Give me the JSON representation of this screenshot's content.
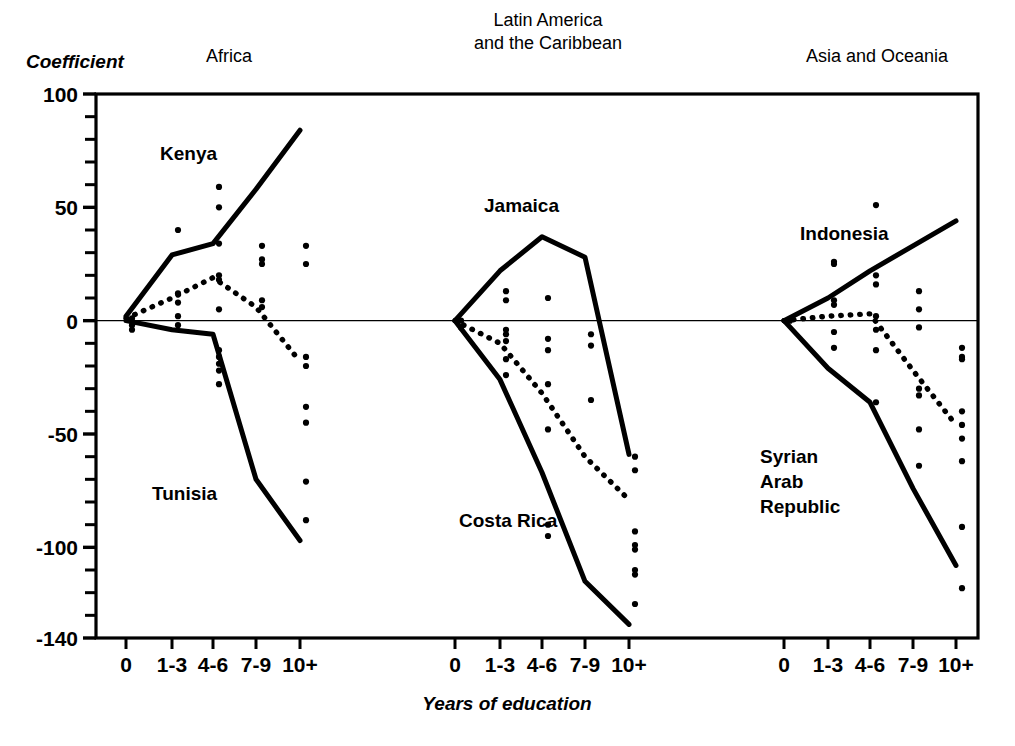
{
  "figure": {
    "y_axis_title": "Coefficient",
    "x_axis_title": "Years of education"
  },
  "chart_data": {
    "type": "scatter",
    "title": "",
    "subtitle": "",
    "xlabel": "Years of education",
    "ylabel": "Coefficient",
    "categories": [
      "0",
      "1-3",
      "4-6",
      "7-9",
      "10+"
    ],
    "ylim": [
      -140,
      100
    ],
    "yticks": [
      100,
      50,
      0,
      -50,
      -100,
      -140
    ],
    "ytick_labels": [
      "100",
      "50",
      "0",
      "-50",
      "-100",
      "-140"
    ],
    "minor_tick_step": 10,
    "grid": false,
    "legend_position": "none",
    "zero_reference_line": 0,
    "panels": [
      {
        "name": "africa",
        "title": "Africa",
        "title_lines": [
          "Africa"
        ],
        "series": [
          {
            "name": "Kenya",
            "role": "upper-envelope",
            "style": "solid",
            "label": "Kenya",
            "x": [
              "0",
              "1-3",
              "4-6",
              "7-9",
              "10+"
            ],
            "values": [
              2,
              29,
              34,
              58,
              84
            ]
          },
          {
            "name": "Tunisia",
            "role": "lower-envelope",
            "style": "solid",
            "label": "Tunisia",
            "x": [
              "0",
              "1-3",
              "4-6",
              "7-9",
              "10+"
            ],
            "values": [
              0,
              -4,
              -6,
              -70,
              -97
            ]
          },
          {
            "name": "median",
            "role": "median",
            "style": "dotted",
            "label": "",
            "x": [
              "0",
              "1-3",
              "4-6",
              "7-9",
              "10+"
            ],
            "values": [
              1,
              10,
              19,
              6,
              -18
            ]
          }
        ],
        "scatter": [
          {
            "x": "0",
            "y": 1
          },
          {
            "x": "0",
            "y": -2
          },
          {
            "x": "0",
            "y": -4
          },
          {
            "x": "1-3",
            "y": 40
          },
          {
            "x": "1-3",
            "y": 12
          },
          {
            "x": "1-3",
            "y": 8
          },
          {
            "x": "1-3",
            "y": 2
          },
          {
            "x": "1-3",
            "y": -2
          },
          {
            "x": "4-6",
            "y": 59
          },
          {
            "x": "4-6",
            "y": 50
          },
          {
            "x": "4-6",
            "y": 34
          },
          {
            "x": "4-6",
            "y": 20
          },
          {
            "x": "4-6",
            "y": 18
          },
          {
            "x": "4-6",
            "y": 5
          },
          {
            "x": "4-6",
            "y": -13
          },
          {
            "x": "4-6",
            "y": -16
          },
          {
            "x": "4-6",
            "y": -19
          },
          {
            "x": "4-6",
            "y": -22
          },
          {
            "x": "4-6",
            "y": -28
          },
          {
            "x": "7-9",
            "y": 33
          },
          {
            "x": "7-9",
            "y": 27
          },
          {
            "x": "7-9",
            "y": 25
          },
          {
            "x": "7-9",
            "y": 9
          },
          {
            "x": "7-9",
            "y": 6
          },
          {
            "x": "10+",
            "y": 33
          },
          {
            "x": "10+",
            "y": 25
          },
          {
            "x": "10+",
            "y": -16
          },
          {
            "x": "10+",
            "y": -20
          },
          {
            "x": "10+",
            "y": -38
          },
          {
            "x": "10+",
            "y": -45
          },
          {
            "x": "10+",
            "y": -71
          },
          {
            "x": "10+",
            "y": -88
          }
        ]
      },
      {
        "name": "latin-america",
        "title": "Latin America and the Caribbean",
        "title_lines": [
          "Latin America",
          "and the Caribbean"
        ],
        "series": [
          {
            "name": "Jamaica",
            "role": "upper-envelope",
            "style": "solid",
            "label": "Jamaica",
            "x": [
              "0",
              "1-3",
              "4-6",
              "7-9",
              "10+"
            ],
            "values": [
              0,
              22,
              37,
              28,
              -59
            ]
          },
          {
            "name": "Costa Rica",
            "role": "lower-envelope",
            "style": "solid",
            "label": "Costa Rica",
            "x": [
              "0",
              "1-3",
              "4-6",
              "7-9",
              "10+"
            ],
            "values": [
              0,
              -26,
              -67,
              -115,
              -134
            ]
          },
          {
            "name": "median",
            "role": "median",
            "style": "dotted",
            "label": "",
            "x": [
              "0",
              "1-3",
              "4-6",
              "7-9",
              "10+"
            ],
            "values": [
              0,
              -10,
              -32,
              -60,
              -79
            ]
          }
        ],
        "scatter": [
          {
            "x": "0",
            "y": 0
          },
          {
            "x": "0",
            "y": -3
          },
          {
            "x": "1-3",
            "y": 13
          },
          {
            "x": "1-3",
            "y": 9
          },
          {
            "x": "1-3",
            "y": -4
          },
          {
            "x": "1-3",
            "y": -6
          },
          {
            "x": "1-3",
            "y": -9
          },
          {
            "x": "1-3",
            "y": -17
          },
          {
            "x": "1-3",
            "y": -24
          },
          {
            "x": "4-6",
            "y": 10
          },
          {
            "x": "4-6",
            "y": -8
          },
          {
            "x": "4-6",
            "y": -13
          },
          {
            "x": "4-6",
            "y": -28
          },
          {
            "x": "4-6",
            "y": -48
          },
          {
            "x": "4-6",
            "y": -90
          },
          {
            "x": "4-6",
            "y": -95
          },
          {
            "x": "7-9",
            "y": -6
          },
          {
            "x": "7-9",
            "y": -11
          },
          {
            "x": "7-9",
            "y": -35
          },
          {
            "x": "10+",
            "y": -60
          },
          {
            "x": "10+",
            "y": -66
          },
          {
            "x": "10+",
            "y": -93
          },
          {
            "x": "10+",
            "y": -99
          },
          {
            "x": "10+",
            "y": -101
          },
          {
            "x": "10+",
            "y": -110
          },
          {
            "x": "10+",
            "y": -112
          },
          {
            "x": "10+",
            "y": -125
          }
        ]
      },
      {
        "name": "asia-oceania",
        "title": "Asia and Oceania",
        "title_lines": [
          "Asia and Oceania"
        ],
        "series": [
          {
            "name": "Indonesia",
            "role": "upper-envelope",
            "style": "solid",
            "label": "Indonesia",
            "x": [
              "0",
              "1-3",
              "4-6",
              "7-9",
              "10+"
            ],
            "values": [
              0,
              10,
              22,
              33,
              44
            ]
          },
          {
            "name": "Syrian Arab Republic",
            "role": "lower-envelope",
            "style": "solid",
            "label": "Syrian Arab Republic",
            "label_lines": [
              "Syrian",
              "Arab",
              "Republic"
            ],
            "x": [
              "0",
              "1-3",
              "4-6",
              "7-9",
              "10+"
            ],
            "values": [
              0,
              -21,
              -36,
              -74,
              -108
            ]
          },
          {
            "name": "median",
            "role": "median",
            "style": "dotted",
            "label": "",
            "x": [
              "0",
              "1-3",
              "4-6",
              "7-9",
              "10+"
            ],
            "values": [
              0,
              2,
              3,
              -22,
              -46
            ]
          }
        ],
        "scatter": [
          {
            "x": "0",
            "y": 0
          },
          {
            "x": "1-3",
            "y": 26
          },
          {
            "x": "1-3",
            "y": 25
          },
          {
            "x": "1-3",
            "y": 9
          },
          {
            "x": "1-3",
            "y": 7
          },
          {
            "x": "1-3",
            "y": -5
          },
          {
            "x": "1-3",
            "y": -12
          },
          {
            "x": "4-6",
            "y": 51
          },
          {
            "x": "4-6",
            "y": 20
          },
          {
            "x": "4-6",
            "y": 16
          },
          {
            "x": "4-6",
            "y": 2
          },
          {
            "x": "4-6",
            "y": -4
          },
          {
            "x": "4-6",
            "y": -13
          },
          {
            "x": "4-6",
            "y": -36
          },
          {
            "x": "7-9",
            "y": 13
          },
          {
            "x": "7-9",
            "y": 5
          },
          {
            "x": "7-9",
            "y": -3
          },
          {
            "x": "7-9",
            "y": -30
          },
          {
            "x": "7-9",
            "y": -33
          },
          {
            "x": "7-9",
            "y": -48
          },
          {
            "x": "7-9",
            "y": -64
          },
          {
            "x": "10+",
            "y": -12
          },
          {
            "x": "10+",
            "y": -16
          },
          {
            "x": "10+",
            "y": -17
          },
          {
            "x": "10+",
            "y": -40
          },
          {
            "x": "10+",
            "y": -46
          },
          {
            "x": "10+",
            "y": -52
          },
          {
            "x": "10+",
            "y": -62
          },
          {
            "x": "10+",
            "y": -91
          },
          {
            "x": "10+",
            "y": -118
          }
        ]
      }
    ]
  }
}
